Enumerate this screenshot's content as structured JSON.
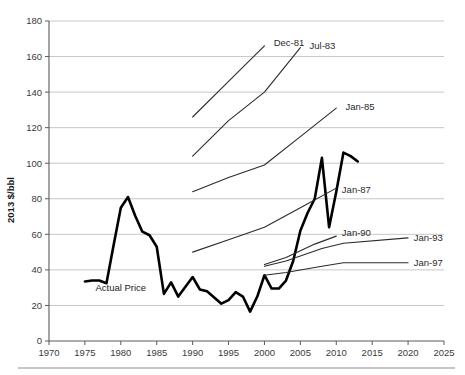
{
  "chart_data": {
    "type": "line",
    "title": "",
    "subtitle": "",
    "xlabel": "",
    "ylabel": "2013 $/bbl",
    "xlim": [
      1970,
      2025
    ],
    "ylim": [
      0,
      180
    ],
    "grid": true,
    "legend_position": "inline-end-of-line",
    "x_ticks": [
      1970,
      1975,
      1980,
      1985,
      1990,
      1995,
      2000,
      2005,
      2010,
      2015,
      2020,
      2025
    ],
    "y_ticks": [
      0,
      20,
      40,
      60,
      80,
      100,
      120,
      140,
      160,
      180
    ],
    "annotations": [
      {
        "text": "Actual Price",
        "x": 1980,
        "y": 28
      }
    ],
    "series": [
      {
        "name": "Actual Price",
        "label": "Actual Price",
        "style": "thick-black",
        "x": [
          1975,
          1976,
          1977,
          1978,
          1979,
          1980,
          1981,
          1982,
          1983,
          1984,
          1985,
          1986,
          1987,
          1988,
          1989,
          1990,
          1991,
          1992,
          1993,
          1994,
          1995,
          1996,
          1997,
          1998,
          1999,
          2000,
          2001,
          2002,
          2003,
          2004,
          2005,
          2006,
          2007,
          2008,
          2009,
          2010,
          2011,
          2012,
          2013
        ],
        "values": [
          33.5,
          34.0,
          34.0,
          32.5,
          54.0,
          75.0,
          81.0,
          70.5,
          61.5,
          59.5,
          53.0,
          26.5,
          33.0,
          25.0,
          30.5,
          36.0,
          29.0,
          28.0,
          24.5,
          21.0,
          23.0,
          27.5,
          25.0,
          16.5,
          25.0,
          37.0,
          29.5,
          29.5,
          34.0,
          45.0,
          62.0,
          72.0,
          80.0,
          103.0,
          64.0,
          84.0,
          106.0,
          104.0,
          101.0
        ]
      },
      {
        "name": "Dec-81",
        "label": "Dec-81",
        "style": "thin-projection",
        "x": [
          1990,
          1995,
          2000
        ],
        "values": [
          126.0,
          146.0,
          166.0
        ],
        "label_x": 2001,
        "label_y": 168
      },
      {
        "name": "Jul-83",
        "label": "Jul-83",
        "style": "thin-projection",
        "x": [
          1990,
          1995,
          2000,
          2005
        ],
        "values": [
          104.0,
          124.0,
          140.0,
          165.0
        ],
        "label_x": 2006,
        "label_y": 166
      },
      {
        "name": "Jan-85",
        "label": "Jan-85",
        "style": "thin-projection",
        "x": [
          1990,
          1995,
          2000,
          2005,
          2010
        ],
        "values": [
          84.0,
          92.0,
          99.0,
          115.0,
          131.0
        ],
        "label_x": 2011,
        "label_y": 132
      },
      {
        "name": "Jan-87",
        "label": "Jan-87",
        "style": "thin-projection",
        "x": [
          1990,
          1995,
          2000,
          2005,
          2010
        ],
        "values": [
          50.0,
          57.0,
          64.0,
          75.0,
          86.0
        ],
        "label_x": 2010.5,
        "label_y": 85
      },
      {
        "name": "Jan-90",
        "label": "Jan-90",
        "style": "thin-projection",
        "x": [
          2000,
          2003,
          2007,
          2010
        ],
        "values": [
          43.0,
          47.0,
          54.5,
          59.0
        ],
        "label_x": 2010.5,
        "label_y": 61
      },
      {
        "name": "Jan-93",
        "label": "Jan-93",
        "style": "thin-projection",
        "x": [
          2000,
          2003,
          2008,
          2011,
          2020
        ],
        "values": [
          42.0,
          45.0,
          52.0,
          55.0,
          58.0
        ],
        "label_x": 2020.5,
        "label_y": 58
      },
      {
        "name": "Jan-97",
        "label": "Jan-97",
        "style": "thin-projection",
        "x": [
          2000,
          2003,
          2008,
          2011,
          2020
        ],
        "values": [
          37.0,
          38.5,
          42.0,
          44.0,
          44.0
        ],
        "label_x": 2020.5,
        "label_y": 44
      }
    ]
  },
  "axes": {
    "y_title": "2013 $/bbl",
    "x_tick_labels": [
      "1970",
      "1975",
      "1980",
      "1985",
      "1990",
      "1995",
      "2000",
      "2005",
      "2010",
      "2015",
      "2020",
      "2025"
    ],
    "y_tick_labels": [
      "0",
      "20",
      "40",
      "60",
      "80",
      "100",
      "120",
      "140",
      "160",
      "180"
    ]
  },
  "labels": {
    "actual_price": "Actual Price",
    "dec81": "Dec-81",
    "jul83": "Jul-83",
    "jan85": "Jan-85",
    "jan87": "Jan-87",
    "jan90": "Jan-90",
    "jan93": "Jan-93",
    "jan97": "Jan-97"
  },
  "colors": {
    "actual_line": "#000000",
    "projection_line": "#2b2b2b",
    "gridline": "#b7b7b7",
    "axis": "#5a5a5a",
    "text": "#1a1a1a"
  }
}
